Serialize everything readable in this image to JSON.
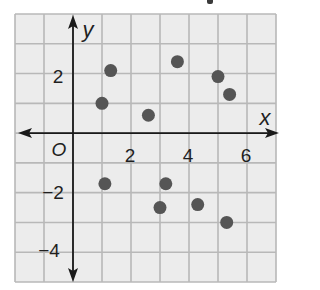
{
  "chart_data": {
    "type": "scatter",
    "title": "",
    "xlabel": "x",
    "ylabel": "y",
    "xlim": [
      -2,
      7
    ],
    "ylim": [
      -5,
      4
    ],
    "grid": true,
    "origin_label": "O",
    "x_ticks": [
      {
        "value": 2,
        "label": "2"
      },
      {
        "value": 4,
        "label": "4"
      },
      {
        "value": 6,
        "label": "6"
      }
    ],
    "y_ticks": [
      {
        "value": 2,
        "label": "2"
      },
      {
        "value": -2,
        "label": "−2"
      },
      {
        "value": -4,
        "label": "−4"
      }
    ],
    "series": [
      {
        "name": "points",
        "points": [
          {
            "x": 1.3,
            "y": 2.1
          },
          {
            "x": 1.0,
            "y": 1.0
          },
          {
            "x": 2.6,
            "y": 0.6
          },
          {
            "x": 3.6,
            "y": 2.4
          },
          {
            "x": 5.0,
            "y": 1.9
          },
          {
            "x": 5.4,
            "y": 1.3
          },
          {
            "x": 1.1,
            "y": -1.7
          },
          {
            "x": 3.2,
            "y": -1.7
          },
          {
            "x": 3.0,
            "y": -2.5
          },
          {
            "x": 4.3,
            "y": -2.4
          },
          {
            "x": 5.3,
            "y": -3.0
          }
        ]
      }
    ]
  },
  "colors": {
    "cell_fill": "#ececec",
    "grid_line": "#b8b8b8",
    "axis": "#1a1a1a",
    "point": "#555555"
  }
}
